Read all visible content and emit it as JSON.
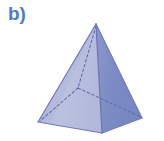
{
  "figure": {
    "label": "b)",
    "label_color": "#4f7cc0",
    "shape_name": "square-pyramid",
    "background_color": "#ffffff",
    "canvas": {
      "width": 164,
      "height": 141
    },
    "colors": {
      "face_left_front": "#b9bedd",
      "face_left_back": "#aab2d6",
      "face_right_front": "#7f8dc5",
      "face_right_back": "#8e9bcf",
      "edge_visible": "#6a77b4",
      "edge_hidden": "#5f6ca8",
      "outline": "#7b88c0"
    },
    "vertices": {
      "apex": {
        "x": 96,
        "y": 24
      },
      "base_left": {
        "x": 38,
        "y": 122
      },
      "base_front": {
        "x": 102,
        "y": 133
      },
      "base_right": {
        "x": 142,
        "y": 118
      },
      "base_back_hidden": {
        "x": 78,
        "y": 88
      }
    },
    "edges": [
      {
        "name": "apex-to-base-left",
        "style": "solid"
      },
      {
        "name": "apex-to-base-front",
        "style": "solid"
      },
      {
        "name": "apex-to-base-right",
        "style": "solid"
      },
      {
        "name": "apex-to-base-back",
        "style": "dashed"
      },
      {
        "name": "base-left-to-base-front",
        "style": "solid"
      },
      {
        "name": "base-front-to-base-right",
        "style": "solid"
      },
      {
        "name": "base-left-to-base-back",
        "style": "dashed"
      },
      {
        "name": "base-back-to-base-right",
        "style": "dashed"
      }
    ]
  }
}
